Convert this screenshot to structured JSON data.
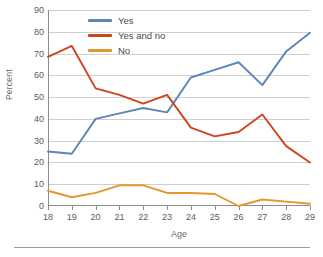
{
  "chart_data": {
    "type": "line",
    "title": "",
    "subtitle": "",
    "xlabel": "Age",
    "ylabel": "Percent",
    "x": [
      18,
      19,
      20,
      21,
      22,
      23,
      24,
      25,
      26,
      27,
      28,
      29
    ],
    "categories": [
      "18",
      "19",
      "20",
      "21",
      "22",
      "23",
      "24",
      "25",
      "26",
      "27",
      "28",
      "29"
    ],
    "xlim": [
      18,
      29
    ],
    "ylim": [
      0,
      90
    ],
    "y_ticks": [
      0,
      10,
      20,
      30,
      40,
      50,
      60,
      70,
      80,
      90
    ],
    "y_tick_labels": [
      "0",
      "10",
      "20",
      "30",
      "40",
      "50",
      "60",
      "70",
      "80",
      "90"
    ],
    "x_ticks": [
      18,
      19,
      20,
      21,
      22,
      23,
      24,
      25,
      26,
      27,
      28,
      29
    ],
    "x_tick_labels": [
      "18",
      "19",
      "20",
      "21",
      "22",
      "23",
      "24",
      "25",
      "26",
      "27",
      "28",
      "29"
    ],
    "grid": "horizontal",
    "legend_position": "top-center",
    "series": [
      {
        "name": "Yes",
        "color": "#5b86b5",
        "values": [
          25,
          24,
          40,
          42.5,
          45,
          43,
          59,
          62.5,
          66,
          55.5,
          71,
          79.5
        ]
      },
      {
        "name": "Yes and no",
        "color": "#cf4420",
        "values": [
          68.5,
          73.5,
          54,
          51,
          47,
          51,
          36,
          32,
          34,
          42,
          27.5,
          20
        ]
      },
      {
        "name": "No",
        "color": "#e4962f",
        "values": [
          7,
          4,
          6,
          9.5,
          9.5,
          6,
          6,
          5.5,
          0,
          3,
          2,
          1
        ]
      }
    ],
    "annotations": []
  },
  "axes": {
    "y_title": "Percent",
    "x_title": "Age"
  },
  "legend": {
    "items": [
      {
        "label": "Yes",
        "color": "#5b86b5"
      },
      {
        "label": "Yes and no",
        "color": "#cf4420"
      },
      {
        "label": "No",
        "color": "#e4962f"
      }
    ]
  },
  "colors": {
    "background": "#ffffff",
    "gridline": "#cfcfcf",
    "axis": "#8c8c8c",
    "tick_text": "#5c5c5c",
    "title_text": "#6b6b6b",
    "footer_rule": "#9a9a9a"
  }
}
